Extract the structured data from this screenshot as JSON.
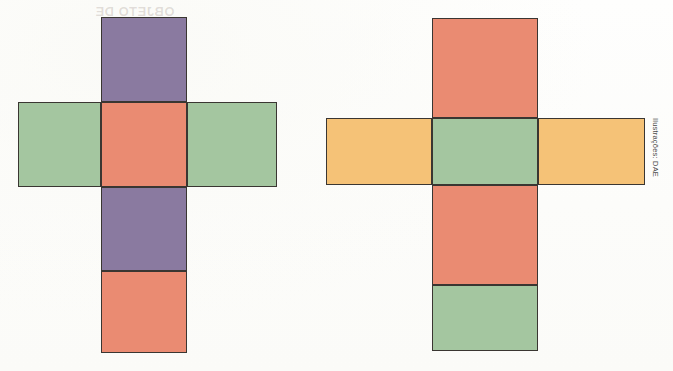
{
  "page": {
    "background_color": "#fdfdfc",
    "width": 673,
    "height": 371
  },
  "credit": {
    "text": "Ilustrações: DAE",
    "orientation": "vertical",
    "color": "#4a4a4a"
  },
  "palette": {
    "purple": "#8a7aa0",
    "green": "#a4c6a0",
    "salmon": "#ea8b72",
    "orange": "#f5c277",
    "outline": "#3a3632",
    "paper": "#fdfdfc"
  },
  "figures": [
    {
      "id": "left-net",
      "name": "cube-net-left",
      "description": "Planificação do cubo em forma de cruz, com faces roxas, verdes e salmão",
      "faces": [
        {
          "name": "top-purple-face",
          "color_key": "purple",
          "color": "#8a7aa0",
          "x": 101,
          "y": 17,
          "w": 86,
          "h": 85
        },
        {
          "name": "left-green-face",
          "color_key": "green",
          "color": "#a4c6a0",
          "x": 18,
          "y": 102,
          "w": 83,
          "h": 85
        },
        {
          "name": "center-salmon-face",
          "color_key": "salmon",
          "color": "#ea8b72",
          "x": 101,
          "y": 102,
          "w": 86,
          "h": 85
        },
        {
          "name": "right-green-face",
          "color_key": "green",
          "color": "#a4c6a0",
          "x": 187,
          "y": 102,
          "w": 90,
          "h": 85
        },
        {
          "name": "lower-purple-face",
          "color_key": "purple",
          "color": "#8a7aa0",
          "x": 101,
          "y": 187,
          "w": 86,
          "h": 84
        },
        {
          "name": "bottom-salmon-face",
          "color_key": "salmon",
          "color": "#ea8b72",
          "x": 101,
          "y": 271,
          "w": 86,
          "h": 82
        }
      ]
    },
    {
      "id": "right-net",
      "name": "cube-net-right",
      "description": "Planificação do cubo em forma de cruz, com faces salmão, verdes e laranjas",
      "faces": [
        {
          "name": "top-salmon-face",
          "color_key": "salmon",
          "color": "#ea8b72",
          "x": 432,
          "y": 18,
          "w": 106,
          "h": 100
        },
        {
          "name": "left-orange-face",
          "color_key": "orange",
          "color": "#f5c277",
          "x": 326,
          "y": 118,
          "w": 106,
          "h": 67
        },
        {
          "name": "center-green-face",
          "color_key": "green",
          "color": "#a4c6a0",
          "x": 432,
          "y": 118,
          "w": 106,
          "h": 67
        },
        {
          "name": "right-orange-face",
          "color_key": "orange",
          "color": "#f5c277",
          "x": 538,
          "y": 118,
          "w": 107,
          "h": 67
        },
        {
          "name": "lower-salmon-face",
          "color_key": "salmon",
          "color": "#ea8b72",
          "x": 432,
          "y": 185,
          "w": 106,
          "h": 100
        },
        {
          "name": "bottom-green-face",
          "color_key": "green",
          "color": "#a4c6a0",
          "x": 432,
          "y": 285,
          "w": 106,
          "h": 66
        }
      ]
    }
  ],
  "bleed_through": [
    {
      "name": "bleed-top-left",
      "text": "OBJETO DE",
      "x": 95,
      "y": 4,
      "size": 13
    },
    {
      "name": "bleed-mid-left-a",
      "text": "EM SALA",
      "x": 30,
      "y": 128,
      "size": 12
    },
    {
      "name": "bleed-mid-left-b",
      "text": "DE AULA",
      "x": 110,
      "y": 132,
      "size": 13
    },
    {
      "name": "bleed-mid-left-c",
      "text": "ATIVIDADE",
      "x": 190,
      "y": 126,
      "size": 12
    },
    {
      "name": "bleed-right-a",
      "text": "1 aluno",
      "x": 452,
      "y": 28,
      "size": 12
    },
    {
      "name": "bleed-right-b",
      "text": "que o cubo",
      "x": 448,
      "y": 52,
      "size": 12
    },
    {
      "name": "bleed-right-c",
      "text": "de faces com",
      "x": 338,
      "y": 126,
      "size": 11
    },
    {
      "name": "bleed-right-d",
      "text": "mesma cor opostas",
      "x": 420,
      "y": 146,
      "size": 11
    },
    {
      "name": "bleed-right-e",
      "text": "no cubo",
      "x": 330,
      "y": 164,
      "size": 11
    }
  ]
}
